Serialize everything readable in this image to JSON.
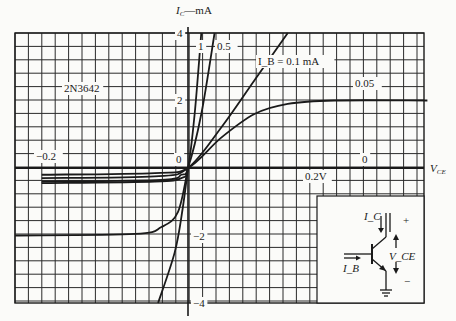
{
  "chart_data": {
    "type": "line",
    "title": "",
    "device_label": "2N3642",
    "xlabel": "V_CE",
    "ylabel": "I_C—mA",
    "x_unit": "V",
    "y_unit": "mA",
    "xlim": [
      -0.26,
      0.36
    ],
    "ylim": [
      -4,
      4
    ],
    "grid": true,
    "x_ticks": [
      {
        "value": -0.2,
        "label": "−0.2"
      },
      {
        "value": 0,
        "label": "0"
      },
      {
        "value": 0.2,
        "label": "0.2V"
      }
    ],
    "y_ticks": [
      {
        "value": 4,
        "label": "4"
      },
      {
        "value": 2,
        "label": "2"
      },
      {
        "value": -2,
        "label": "−2"
      },
      {
        "value": -4,
        "label": "−4"
      }
    ],
    "series": [
      {
        "name": "I_B = 1 mA",
        "label": "1",
        "points": [
          [
            -0.22,
            -0.45
          ],
          [
            -0.05,
            -0.4
          ],
          [
            -0.01,
            -0.3
          ],
          [
            0,
            0
          ],
          [
            0.01,
            1.6
          ],
          [
            0.02,
            4
          ]
        ]
      },
      {
        "name": "I_B = 0.5 mA",
        "label": "0.5",
        "points": [
          [
            -0.22,
            -0.4
          ],
          [
            -0.04,
            -0.35
          ],
          [
            -0.01,
            -0.2
          ],
          [
            0,
            0
          ],
          [
            0.02,
            1.6
          ],
          [
            0.04,
            4
          ]
        ]
      },
      {
        "name": "I_B = 0.1 mA",
        "label": "I_B = 0.1 mA",
        "points": [
          [
            -0.22,
            -0.3
          ],
          [
            -0.05,
            -0.25
          ],
          [
            0,
            0
          ],
          [
            0.05,
            1.2
          ],
          [
            0.1,
            2.6
          ],
          [
            0.15,
            4
          ]
        ]
      },
      {
        "name": "I_B = 0.05 mA",
        "label": "0.05",
        "points": [
          [
            -0.22,
            -0.2
          ],
          [
            -0.05,
            -0.15
          ],
          [
            0,
            0
          ],
          [
            0.05,
            0.9
          ],
          [
            0.1,
            1.6
          ],
          [
            0.15,
            1.9
          ],
          [
            0.22,
            2.0
          ],
          [
            0.36,
            2.0
          ]
        ]
      },
      {
        "name": "I_B = 0",
        "label": "0",
        "points": [
          [
            -0.26,
            0
          ],
          [
            0.36,
            0
          ]
        ]
      },
      {
        "name": "I_B = -0.2 mA",
        "label": "−0.2",
        "points": [
          [
            -0.26,
            -2.0
          ],
          [
            -0.08,
            -1.95
          ],
          [
            -0.04,
            -1.75
          ],
          [
            -0.015,
            -1.3
          ],
          [
            0,
            0
          ]
        ]
      },
      {
        "name": "reverse steep",
        "label": "",
        "points": [
          [
            -0.045,
            -4
          ],
          [
            -0.02,
            -2.5
          ],
          [
            -0.008,
            -1.2
          ],
          [
            0,
            0
          ]
        ]
      }
    ],
    "annotations": [
      "2N3642",
      "0.05",
      "I_B = 0.1 mA",
      "1",
      "0.5",
      "−0.2",
      "0"
    ]
  },
  "inset": {
    "label_ic": "I_C",
    "label_ib": "I_B",
    "label_vce": "V_CE",
    "plus": "+",
    "minus": "−"
  }
}
